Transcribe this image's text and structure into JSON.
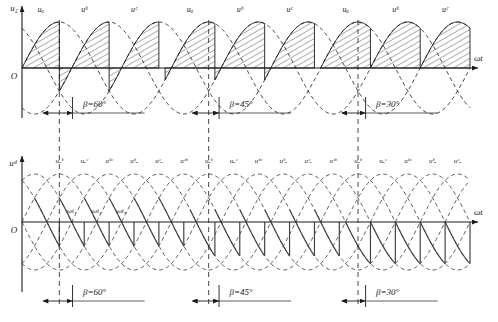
{
  "figure": {
    "type": "three-phase-rectifier-waveform",
    "axis_origin_label": "O",
    "x_axis_label": "ωt"
  },
  "charts": [
    {
      "id": "upper",
      "y_axis_label": "u₂",
      "x_axis_label": "ωt",
      "origin_label": "O",
      "wave_labels": [
        "uₐ",
        "uᵇ",
        "uᶜ",
        "uₐ",
        "uᵇ",
        "uᶜ",
        "uₐ",
        "uᵇ",
        "uᶜ",
        "uₐ",
        "uᵇ"
      ],
      "beta_marks": [
        {
          "label": "β=60°"
        },
        {
          "label": "β=45°"
        },
        {
          "label": "β=30°"
        }
      ]
    },
    {
      "id": "lower",
      "y_axis_label": "uᵈ",
      "x_axis_label": "ωt",
      "origin_label": "O",
      "wave_labels": [
        "uₐᵇ",
        "uₐᶜ",
        "uᵇᶜ",
        "uᵇₐ",
        "uᶜₐ",
        "uᶜᵇ",
        "uₐᵇ",
        "uₐᶜ",
        "uᵇᶜ",
        "uᵇₐ",
        "uᶜₐ",
        "uᶜᵇ",
        "uₐᵇ",
        "uₐᶜ",
        "uᵇᶜ",
        "uᵇₐ",
        "uᶜₐ",
        "uᶜᵇ",
        "uₐᵇ",
        "uₐᶜ",
        "uᵇᶜ"
      ],
      "time_marks": [
        "ωt₁",
        "ωt₂",
        "ωt₃"
      ],
      "beta_marks": [
        {
          "label": "β=60°"
        },
        {
          "label": "β=45°"
        },
        {
          "label": "β=30°"
        }
      ]
    }
  ],
  "chart_data": {
    "type": "line",
    "title": "",
    "xlabel": "ωt",
    "ylabel": "u₂ / uᵈ",
    "subplots": [
      {
        "name": "upper",
        "ylabel": "u₂",
        "xlabel": "ωt",
        "grid": false,
        "legend": "inline-labels",
        "series": [
          {
            "name": "uₐ",
            "type": "sine",
            "amplitude": 1.0,
            "phase_deg": 0,
            "style": "dashed"
          },
          {
            "name": "uᵇ",
            "type": "sine",
            "amplitude": 1.0,
            "phase_deg": -120,
            "style": "dashed"
          },
          {
            "name": "uᶜ",
            "type": "sine",
            "amplitude": 1.0,
            "phase_deg": -240,
            "style": "dashed"
          }
        ],
        "shaded_regions_note": "hatched area = conducting phase voltage segment, 120° wide, terminated by vertical commutation edge",
        "labels_sequence": [
          "uₐ",
          "uᵇ",
          "uᶜ",
          "uₐ",
          "uᵇ",
          "uᶜ",
          "uₐ",
          "uᵇ",
          "uᶜ",
          "uₐ",
          "uᵇ"
        ],
        "beta_values_deg": [
          60,
          45,
          30
        ]
      },
      {
        "name": "lower",
        "ylabel": "uᵈ",
        "xlabel": "ωt",
        "grid": false,
        "series": [
          {
            "name": "line-voltages",
            "type": "six-sine-envelope",
            "amplitude": 1.0,
            "count": 6,
            "style": "dashed"
          },
          {
            "name": "uᵈ output",
            "type": "inverter-output",
            "style": "solid",
            "polarity": "negative"
          }
        ],
        "labels_sequence": [
          "uₐᵇ",
          "uₐᶜ",
          "uᵇᶜ",
          "uᵇₐ",
          "uᶜₐ",
          "uᶜᵇ"
        ],
        "time_marks": [
          "ωt₁",
          "ωt₂",
          "ωt₃"
        ],
        "beta_values_deg": [
          60,
          45,
          30
        ]
      }
    ]
  },
  "style": {
    "line_color": "#1a1a1a",
    "hatch_color": "#333333",
    "background": "#ffffff"
  }
}
